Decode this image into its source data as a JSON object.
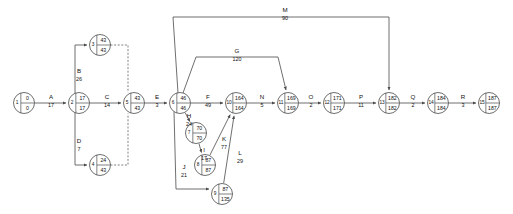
{
  "diagram": {
    "type": "pert-cpm-activity-on-arrow-network",
    "title": "",
    "nodes": [
      {
        "id": "1",
        "early": "0",
        "late": "0",
        "cx": 24,
        "cy": 103,
        "r": 10.5
      },
      {
        "id": "2",
        "early": "17",
        "late": "17",
        "cx": 79,
        "cy": 103,
        "r": 10.5
      },
      {
        "id": "3",
        "early": "43",
        "late": "43",
        "cx": 100,
        "cy": 45,
        "r": 10.5
      },
      {
        "id": "4",
        "early": "24",
        "late": "43",
        "cx": 100,
        "cy": 165,
        "r": 10.5
      },
      {
        "id": "5",
        "early": "43",
        "late": "43",
        "cx": 134,
        "cy": 103,
        "r": 10.5
      },
      {
        "id": "6",
        "early": "46",
        "late": "46",
        "cx": 180,
        "cy": 103,
        "r": 10.5
      },
      {
        "id": "7",
        "early": "70",
        "late": "70",
        "cx": 196,
        "cy": 133,
        "r": 10.5
      },
      {
        "id": "8",
        "early": "87",
        "late": "87",
        "cx": 205,
        "cy": 165,
        "r": 10.5
      },
      {
        "id": "9",
        "early": "87",
        "late": "135",
        "cx": 222,
        "cy": 194,
        "r": 10.5
      },
      {
        "id": "10",
        "early": "164",
        "late": "164",
        "cx": 236,
        "cy": 103,
        "r": 10.5
      },
      {
        "id": "11",
        "early": "169",
        "late": "169",
        "cx": 288,
        "cy": 103,
        "r": 10.5
      },
      {
        "id": "12",
        "early": "171",
        "late": "171",
        "cx": 334,
        "cy": 103,
        "r": 10.5
      },
      {
        "id": "13",
        "early": "182",
        "late": "182",
        "cx": 389,
        "cy": 103,
        "r": 10.5
      },
      {
        "id": "14",
        "early": "184",
        "late": "184",
        "cx": 438,
        "cy": 103,
        "r": 10.5
      },
      {
        "id": "15",
        "early": "187",
        "late": "187",
        "cx": 489,
        "cy": 103,
        "r": 10.5
      }
    ],
    "activities": [
      {
        "name": "A",
        "duration": "17",
        "from": "1",
        "to": "2",
        "label_x": 51,
        "label_y": 99
      },
      {
        "name": "B",
        "duration": "26",
        "from": "2",
        "to": "3",
        "label_x": 79,
        "label_y": 73
      },
      {
        "name": "C",
        "duration": "14",
        "from": "2",
        "to": "5",
        "label_x": 107,
        "label_y": 99
      },
      {
        "name": "D",
        "duration": "7",
        "from": "2",
        "to": "4",
        "label_x": 79,
        "label_y": 143
      },
      {
        "name": "E",
        "duration": "3",
        "from": "5",
        "to": "6",
        "label_x": 157,
        "label_y": 99
      },
      {
        "name": "F",
        "duration": "49",
        "from": "6",
        "to": "10",
        "label_x": 208,
        "label_y": 99
      },
      {
        "name": "G",
        "duration": "120",
        "from": "6",
        "to": "11",
        "label_x": 237,
        "label_y": 53
      },
      {
        "name": "H",
        "duration": "24",
        "from": "6",
        "to": "7",
        "label_x": 189,
        "label_y": 118
      },
      {
        "name": "I",
        "duration": "17",
        "from": "7",
        "to": "8",
        "label_x": 204,
        "label_y": 152
      },
      {
        "name": "J",
        "duration": "21",
        "from": "6",
        "to": "9",
        "label_x": 184,
        "label_y": 169
      },
      {
        "name": "K",
        "duration": "77",
        "from": "8",
        "to": "10",
        "label_x": 224,
        "label_y": 141
      },
      {
        "name": "L",
        "duration": "29",
        "from": "9",
        "to": "10",
        "label_x": 240,
        "label_y": 155
      },
      {
        "name": "M",
        "duration": "90",
        "from": "6",
        "to": "13",
        "label_x": 285,
        "label_y": 12
      },
      {
        "name": "N",
        "duration": "5",
        "from": "10",
        "to": "11",
        "label_x": 262,
        "label_y": 99
      },
      {
        "name": "O",
        "duration": "2",
        "from": "11",
        "to": "12",
        "label_x": 311,
        "label_y": 99
      },
      {
        "name": "P",
        "duration": "11",
        "from": "12",
        "to": "13",
        "label_x": 361,
        "label_y": 99
      },
      {
        "name": "Q",
        "duration": "2",
        "from": "13",
        "to": "14",
        "label_x": 413,
        "label_y": 99
      },
      {
        "name": "R",
        "duration": "3",
        "from": "14",
        "to": "15",
        "label_x": 463,
        "label_y": 99
      }
    ],
    "dummy_links": [
      {
        "from": "3",
        "to": "5"
      },
      {
        "from": "4",
        "to": "5"
      }
    ],
    "colors": {
      "line": "#4a4a4a",
      "node_fill": "#ffffff",
      "text": "#111111",
      "background": "#ffffff"
    }
  }
}
